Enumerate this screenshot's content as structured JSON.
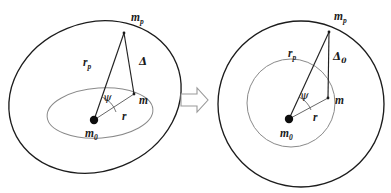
{
  "figure": {
    "width": 391,
    "height": 193,
    "background": "#ffffff",
    "kind": "two-panel physics diagram of orbital geometry",
    "colors": {
      "outer_orbit_stroke": "#1c1c1c",
      "inner_orbit_stroke": "#8a8a8a",
      "vector_stroke": "#222222",
      "label_fill": "#1a1a1a",
      "transition_arrow_stroke": "#9a9a9a",
      "transition_arrow_fill": "#ffffff",
      "body_dot_fill": "#0d0d0d"
    }
  },
  "left_panel": {
    "name": "elliptical-orbit-panel",
    "outer_orbit": {
      "shape": "tilted-ellipse",
      "cx": 95,
      "cy": 97,
      "rx": 88,
      "ry": 74,
      "rotation_deg": -22
    },
    "inner_orbit": {
      "shape": "flattened-ellipse",
      "cx": 100,
      "cy": 113,
      "rx": 53,
      "ry": 25,
      "rotation_deg": -4
    },
    "points": {
      "m0": {
        "x": 94,
        "y": 120
      },
      "m": {
        "x": 134,
        "y": 94
      },
      "mp": {
        "x": 124,
        "y": 33
      }
    },
    "labels": {
      "mp": "m",
      "mp_sub": "p",
      "m": "m",
      "m0": "m",
      "m0_sub": "0",
      "rp": "r",
      "rp_sub": "p",
      "r": "r",
      "psi": "ψ",
      "delta": "Δ",
      "delta_sub": ""
    }
  },
  "right_panel": {
    "name": "circular-orbit-panel",
    "outer_orbit": {
      "shape": "circle",
      "cx": 301,
      "cy": 104,
      "rx": 83,
      "ry": 83,
      "rotation_deg": 0
    },
    "inner_orbit": {
      "shape": "circle",
      "cx": 291,
      "cy": 103,
      "rx": 44,
      "ry": 44,
      "rotation_deg": 0
    },
    "points": {
      "m0": {
        "x": 289,
        "y": 119
      },
      "m": {
        "x": 328,
        "y": 98
      },
      "mp": {
        "x": 329,
        "y": 32
      }
    },
    "labels": {
      "mp": "m",
      "mp_sub": "p",
      "m": "m",
      "m0": "m",
      "m0_sub": "0",
      "rp": "r",
      "rp_sub": "p",
      "r": "r",
      "psi": "ψ",
      "delta": "Δ",
      "delta_sub": "0"
    }
  },
  "transition_arrow": {
    "name": "rightwards-transition-arrow",
    "direction": "right",
    "x": 181,
    "y": 88,
    "width": 26,
    "height": 24
  }
}
